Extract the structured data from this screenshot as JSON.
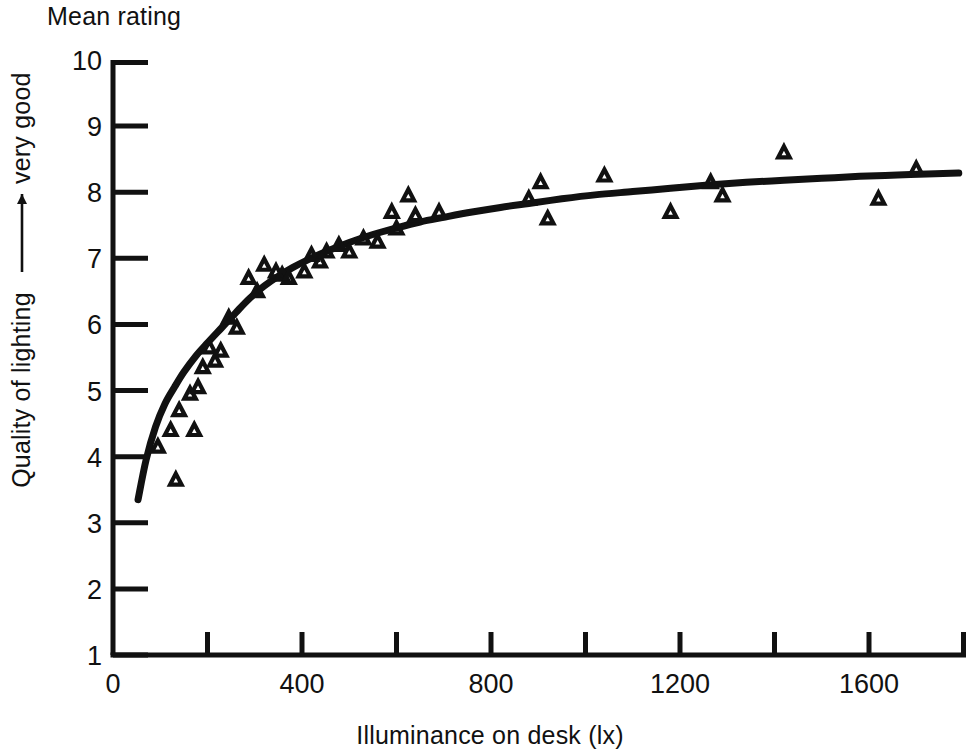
{
  "figure": {
    "top_label": "Mean rating",
    "x_axis_caption": "Illuminance on desk (lx)",
    "y_axis_caption_left": "Quality of lighting",
    "y_axis_caption_right": "very good",
    "ink_color": "#111111",
    "background_color": "#ffffff"
  },
  "chart_data": {
    "type": "scatter",
    "title": "Mean rating",
    "xlabel": "Illuminance on desk (lx)",
    "ylabel": "Quality of lighting —→ very good",
    "xlim": [
      0,
      1800
    ],
    "ylim": [
      1,
      10
    ],
    "grid": false,
    "legend": null,
    "x_ticks_major": [
      0,
      400,
      800,
      1200,
      1600
    ],
    "x_ticks_minor": [
      200,
      600,
      1000,
      1400,
      1800
    ],
    "x_tick_labels": [
      "0",
      "400",
      "800",
      "1200",
      "1600"
    ],
    "y_ticks": [
      1,
      2,
      3,
      4,
      5,
      6,
      7,
      8,
      9,
      10
    ],
    "y_tick_labels": [
      "1",
      "2",
      "3",
      "4",
      "5",
      "6",
      "7",
      "8",
      "9",
      "10"
    ],
    "marker": "open-triangle-up",
    "series": [
      {
        "name": "Mean rating observations",
        "marker": "open-triangle-up",
        "points": [
          [
            95,
            4.15
          ],
          [
            122,
            4.4
          ],
          [
            133,
            3.65
          ],
          [
            140,
            4.7
          ],
          [
            163,
            4.95
          ],
          [
            172,
            4.4
          ],
          [
            180,
            5.05
          ],
          [
            190,
            5.35
          ],
          [
            204,
            5.65
          ],
          [
            216,
            5.45
          ],
          [
            228,
            5.6
          ],
          [
            245,
            6.1
          ],
          [
            262,
            5.95
          ],
          [
            287,
            6.7
          ],
          [
            305,
            6.5
          ],
          [
            320,
            6.9
          ],
          [
            345,
            6.8
          ],
          [
            358,
            6.75
          ],
          [
            372,
            6.7
          ],
          [
            405,
            6.8
          ],
          [
            420,
            7.05
          ],
          [
            438,
            6.95
          ],
          [
            452,
            7.1
          ],
          [
            478,
            7.2
          ],
          [
            500,
            7.1
          ],
          [
            530,
            7.3
          ],
          [
            560,
            7.25
          ],
          [
            590,
            7.7
          ],
          [
            600,
            7.45
          ],
          [
            625,
            7.95
          ],
          [
            640,
            7.65
          ],
          [
            690,
            7.7
          ],
          [
            880,
            7.9
          ],
          [
            905,
            8.15
          ],
          [
            920,
            7.6
          ],
          [
            1040,
            8.25
          ],
          [
            1180,
            7.7
          ],
          [
            1265,
            8.15
          ],
          [
            1290,
            7.95
          ],
          [
            1420,
            8.6
          ],
          [
            1620,
            7.9
          ],
          [
            1700,
            8.35
          ]
        ]
      },
      {
        "name": "Fitted saturating curve",
        "type": "line",
        "points": [
          [
            53,
            3.35
          ],
          [
            70,
            3.95
          ],
          [
            90,
            4.45
          ],
          [
            110,
            4.8
          ],
          [
            130,
            5.05
          ],
          [
            150,
            5.28
          ],
          [
            175,
            5.52
          ],
          [
            200,
            5.72
          ],
          [
            230,
            5.95
          ],
          [
            260,
            6.18
          ],
          [
            290,
            6.4
          ],
          [
            320,
            6.58
          ],
          [
            350,
            6.73
          ],
          [
            380,
            6.86
          ],
          [
            410,
            6.97
          ],
          [
            450,
            7.1
          ],
          [
            500,
            7.24
          ],
          [
            550,
            7.36
          ],
          [
            600,
            7.46
          ],
          [
            650,
            7.55
          ],
          [
            700,
            7.62
          ],
          [
            760,
            7.7
          ],
          [
            820,
            7.77
          ],
          [
            880,
            7.83
          ],
          [
            950,
            7.9
          ],
          [
            1020,
            7.96
          ],
          [
            1100,
            8.01
          ],
          [
            1180,
            8.06
          ],
          [
            1260,
            8.11
          ],
          [
            1340,
            8.15
          ],
          [
            1420,
            8.18
          ],
          [
            1500,
            8.21
          ],
          [
            1580,
            8.24
          ],
          [
            1660,
            8.26
          ],
          [
            1740,
            8.28
          ],
          [
            1790,
            8.29
          ]
        ]
      }
    ]
  }
}
